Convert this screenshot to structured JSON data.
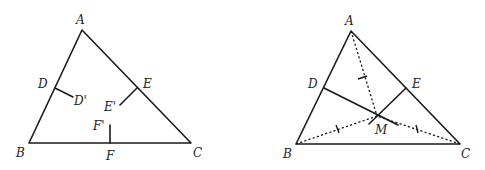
{
  "figure_left": {
    "title": "Triangle ABC with perpendicular bisector segments",
    "labels": {
      "A": "A",
      "B": "B",
      "C": "C",
      "D": "D",
      "D_prime": "D'",
      "E": "E",
      "E_prime": "E'",
      "F": "F",
      "F_prime": "F'"
    }
  },
  "figure_right": {
    "title": "Triangle ABC with circumcenter M and equal distances",
    "labels": {
      "A": "A",
      "B": "B",
      "C": "C",
      "D": "D",
      "E": "E",
      "M": "M"
    }
  },
  "colors": {
    "stroke": "#1a1a1a",
    "background": "#ffffff"
  }
}
